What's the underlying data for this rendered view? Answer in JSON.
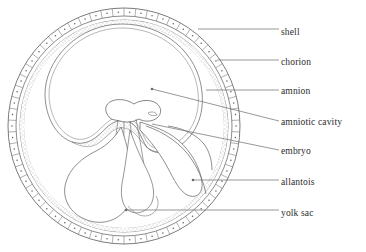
{
  "diagram": {
    "background_color": "#ffffff",
    "line_color": "#5a5a5a",
    "leader_color": "#6b6b6b",
    "text_color": "#2b2b2b",
    "labels": [
      {
        "id": "shell",
        "text": "shell",
        "text_x": 281,
        "text_y": 28,
        "leader_x1": 198,
        "leader_y1": 29,
        "leader_x2": 279,
        "leader_y2": 29,
        "dot": false
      },
      {
        "id": "chorion",
        "text": "chorion",
        "text_x": 281,
        "text_y": 58,
        "leader_x1": 217,
        "leader_y1": 60,
        "leader_x2": 279,
        "leader_y2": 60,
        "dot": false
      },
      {
        "id": "amnion",
        "text": "amnion",
        "text_x": 281,
        "text_y": 87,
        "leader_x1": 206,
        "leader_y1": 90,
        "leader_x2": 279,
        "leader_y2": 90,
        "dot": false
      },
      {
        "id": "amniotic-cavity",
        "text": "amniotic cavity",
        "text_x": 281,
        "text_y": 118,
        "leader_x1": 152,
        "leader_y1": 89,
        "leader_x2": 279,
        "leader_y2": 121,
        "dot": true,
        "dot_x": 152,
        "dot_y": 89
      },
      {
        "id": "embryo",
        "text": "embryo",
        "text_x": 281,
        "text_y": 147,
        "leader_x1": 152,
        "leader_y1": 124,
        "leader_x2": 279,
        "leader_y2": 150,
        "dot": false
      },
      {
        "id": "allantois",
        "text": "allantois",
        "text_x": 281,
        "text_y": 178,
        "leader_x1": 193,
        "leader_y1": 180,
        "leader_x2": 279,
        "leader_y2": 180,
        "dot": true,
        "dot_x": 193,
        "dot_y": 180
      },
      {
        "id": "yolk-sac",
        "text": "yolk sac",
        "text_x": 281,
        "text_y": 209,
        "leader_x1": 126,
        "leader_y1": 210,
        "leader_x2": 279,
        "leader_y2": 210,
        "dot": true,
        "dot_x": 126,
        "dot_y": 210
      }
    ],
    "structures": {
      "shell": {
        "name": "shell",
        "shape": "segmented-ring",
        "center_x": 124,
        "center_y": 126,
        "outer_rx": 116,
        "outer_ry": 118,
        "thickness": 8,
        "segments": 62
      },
      "chorion": {
        "name": "chorion",
        "shape": "stippled-ring",
        "center_x": 124,
        "center_y": 126,
        "rx": 104,
        "ry": 106,
        "thickness": 4
      },
      "amnion": {
        "name": "amnion",
        "shape": "stippled-sac",
        "center_x": 120,
        "center_y": 92,
        "rx": 73,
        "ry": 64
      },
      "amniotic_cavity": {
        "name": "amniotic cavity",
        "shape": "open-space"
      },
      "embryo": {
        "name": "embryo",
        "shape": "mushroom-form",
        "center_x": 122,
        "center_y": 126
      },
      "allantois": {
        "name": "allantois",
        "shape": "lobe"
      },
      "yolk_sac": {
        "name": "yolk sac",
        "shape": "teardrop-blob"
      }
    }
  }
}
